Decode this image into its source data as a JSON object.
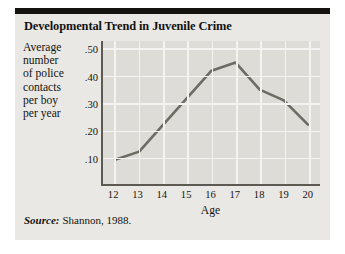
{
  "figure": {
    "title": "Developmental Trend in Juvenile Crime",
    "source_label": "Source:",
    "source_text": "Shannon, 1988.",
    "colors": {
      "panel_bg": "#dedcd7",
      "figure_bg": "#e9e8e4",
      "top_bar": "#15130f",
      "gridline": "#f4f3f1",
      "axis": "#5d5a54",
      "series_line": "#6e6a64",
      "text": "#15130f"
    }
  },
  "ylabel_lines": [
    "Average",
    "number",
    "of police",
    "contacts",
    "per boy",
    "per year"
  ],
  "chart_data": {
    "type": "line",
    "title": "Developmental Trend in Juvenile Crime",
    "xlabel": "Age",
    "ylabel": "Average number of police contacts per boy per year",
    "x": [
      12,
      13,
      14,
      15,
      16,
      17,
      18,
      19,
      20
    ],
    "xticklabels": [
      "12",
      "13",
      "14",
      "15",
      "16",
      "17",
      "18",
      "19",
      "20"
    ],
    "values": [
      0.09,
      0.12,
      0.22,
      0.32,
      0.42,
      0.45,
      0.35,
      0.31,
      0.22
    ],
    "yticks": [
      0.1,
      0.2,
      0.3,
      0.4,
      0.5
    ],
    "yticklabels": [
      ".10",
      ".20",
      ".30",
      ".40",
      ".50"
    ],
    "xlim": [
      11.5,
      20.5
    ],
    "ylim": [
      0.0,
      0.53
    ],
    "grid": true,
    "legend": "none",
    "series_name": "Average number of police contacts per boy per year"
  }
}
